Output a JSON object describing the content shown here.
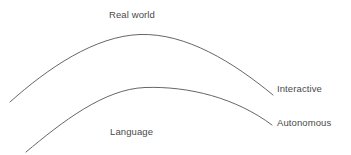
{
  "diagram": {
    "type": "conceptual-curve-diagram",
    "background_color": "#ffffff",
    "line_color": "#555555",
    "text_color": "#4a4a4a",
    "labels": {
      "top_center": "Real world",
      "bottom_center": "Language",
      "upper_curve_end": "Interactive",
      "lower_curve_end": "Autonomous"
    },
    "curves": [
      {
        "name": "upper-curve",
        "label": "Interactive",
        "start": [
          10,
          102
        ],
        "apex": [
          140,
          34
        ],
        "end": [
          273,
          95
        ]
      },
      {
        "name": "lower-curve",
        "label": "Autonomous",
        "start": [
          26,
          152
        ],
        "apex": [
          145,
          87
        ],
        "end": [
          272,
          125
        ]
      }
    ]
  }
}
